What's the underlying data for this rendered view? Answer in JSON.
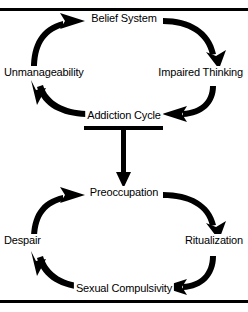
{
  "diagram": {
    "stroke_color": "#000000",
    "background_color": "#ffffff",
    "rules": [
      {
        "name": "top-rule",
        "y": 8,
        "thickness": 3
      },
      {
        "name": "bottom-rule",
        "y": 300,
        "thickness": 3
      }
    ],
    "cycles": [
      {
        "name": "upper-cycle",
        "nodes": [
          {
            "id": "belief-system",
            "label": "Belief System",
            "x": 124,
            "y": 18,
            "align": "center"
          },
          {
            "id": "impaired-thinking",
            "label": "Impaired Thinking",
            "x": 244,
            "y": 72,
            "align": "right"
          },
          {
            "id": "addiction-cycle",
            "label": "Addiction Cycle",
            "x": 124,
            "y": 115,
            "align": "center"
          },
          {
            "id": "unmanageability",
            "label": "Unmanageability",
            "x": 4,
            "y": 72,
            "align": "left"
          }
        ],
        "arrows": [
          {
            "from": "unmanageability",
            "to": "belief-system",
            "direction": "right"
          },
          {
            "from": "belief-system",
            "to": "impaired-thinking",
            "direction": "down"
          },
          {
            "from": "impaired-thinking",
            "to": "addiction-cycle",
            "direction": "left"
          },
          {
            "from": "addiction-cycle",
            "to": "unmanageability",
            "direction": "up"
          }
        ]
      },
      {
        "name": "lower-cycle",
        "nodes": [
          {
            "id": "preoccupation",
            "label": "Preoccupation",
            "x": 124,
            "y": 192,
            "align": "center"
          },
          {
            "id": "ritualization",
            "label": "Ritualization",
            "x": 244,
            "y": 240,
            "align": "right"
          },
          {
            "id": "sexual-compulsivity",
            "label": "Sexual Compulsivity",
            "x": 124,
            "y": 288,
            "align": "center"
          },
          {
            "id": "despair",
            "label": "Despair",
            "x": 4,
            "y": 240,
            "align": "left"
          }
        ],
        "arrows": [
          {
            "from": "despair",
            "to": "preoccupation",
            "direction": "right"
          },
          {
            "from": "preoccupation",
            "to": "ritualization",
            "direction": "down"
          },
          {
            "from": "ritualization",
            "to": "sexual-compulsivity",
            "direction": "left"
          },
          {
            "from": "sexual-compulsivity",
            "to": "despair",
            "direction": "up"
          }
        ]
      }
    ],
    "connector": {
      "name": "addiction-to-preoccupation-connector",
      "shape": "tee-with-down-arrow",
      "bar_x1": 84,
      "bar_x2": 163,
      "bar_y": 128,
      "bar_thickness": 4,
      "stem_x": 124,
      "stem_y1": 130,
      "stem_y2": 178,
      "stem_thickness": 4
    }
  }
}
